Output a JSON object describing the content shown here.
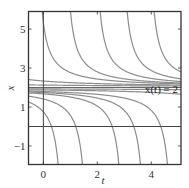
{
  "chart_data": {
    "type": "line",
    "title": "",
    "xlabel": "t",
    "ylabel": "x",
    "xlim": [
      -0.55,
      5.1
    ],
    "ylim": [
      -1.95,
      5.9
    ],
    "xticks": [
      0,
      2,
      4
    ],
    "yticks": [
      -1,
      1,
      3,
      5
    ],
    "xtick_labels": [
      "0",
      "2",
      "4"
    ],
    "ytick_labels": [
      "−1",
      "1",
      "3",
      "5"
    ],
    "grid": false,
    "annotations": [
      {
        "text": "x(t) = 2",
        "x": 4.35,
        "y": 1.55
      }
    ],
    "reference_lines": [
      {
        "orientation": "horizontal",
        "value": 2,
        "label": "x(t) = 2"
      },
      {
        "orientation": "horizontal",
        "value": 0
      },
      {
        "orientation": "vertical",
        "value": 0
      }
    ],
    "series_description": "Solution curves of x' = -(x-2)^2: x(t) = 2 + 1/(t - c)",
    "series": [
      {
        "name": "upper c=-0.3",
        "family": "above",
        "c": -0.3
      },
      {
        "name": "upper c=0.75",
        "family": "above",
        "c": 0.75
      },
      {
        "name": "upper c=1.85",
        "family": "above",
        "c": 1.85
      },
      {
        "name": "upper c=2.85",
        "family": "above",
        "c": 2.85
      },
      {
        "name": "upper c=3.85",
        "family": "above",
        "c": 3.85
      },
      {
        "name": "upper c=-3",
        "family": "above",
        "c": -3
      },
      {
        "name": "upper c=-8",
        "family": "above",
        "c": -8
      },
      {
        "name": "lower c=0.8",
        "family": "below",
        "c": 0.8
      },
      {
        "name": "lower c=1.7",
        "family": "below",
        "c": 1.7
      },
      {
        "name": "lower c=3.05",
        "family": "below",
        "c": 3.05
      },
      {
        "name": "lower c=3.85",
        "family": "below",
        "c": 3.85
      },
      {
        "name": "lower c=4.85",
        "family": "below",
        "c": 4.85
      },
      {
        "name": "lower c=8",
        "family": "below",
        "c": 8
      },
      {
        "name": "lower c=14",
        "family": "below",
        "c": 14
      }
    ]
  },
  "colors": {
    "curve": "#8c8c8c",
    "frame": "#333333",
    "reference": "#555555"
  }
}
